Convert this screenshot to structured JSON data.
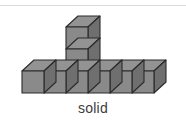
{
  "figure": {
    "caption": "solid",
    "icon_name": "isometric-cube-solid-icon",
    "colors": {
      "front_face": "#8a8a8a",
      "top_face": "#939393",
      "side_face": "#6f6f6f",
      "outline": "#2b2b2b",
      "background": "#ffffff",
      "rule": "#d9d9d9",
      "caption_text": "#3b3b3b"
    },
    "geometry": {
      "cube_width": 22,
      "cube_height": 22,
      "depth_x": 12,
      "depth_y": -11,
      "origin_x": 22,
      "origin_y": 85,
      "base_row_count": 6,
      "stack_column_index": 2,
      "stack_height": 2,
      "total_cubes": 8
    }
  }
}
